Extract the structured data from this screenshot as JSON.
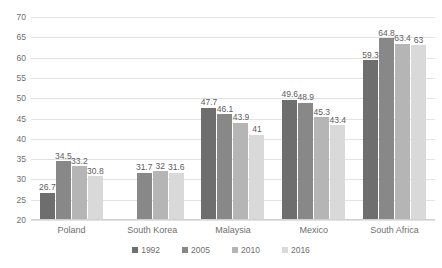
{
  "chart_data": {
    "type": "bar",
    "title": "",
    "subtitle": "",
    "xlabel": "",
    "ylabel": "",
    "categories": [
      "Poland",
      "South Korea",
      "Malaysia",
      "Mexico",
      "South Africa"
    ],
    "series": [
      {
        "name": "1992",
        "color": "#6e6e6e",
        "values": [
          26.7,
          null,
          47.7,
          49.6,
          59.3
        ],
        "labels": [
          "26.7",
          "",
          "47.7",
          "49.6",
          "59.3"
        ]
      },
      {
        "name": "2005",
        "color": "#888888",
        "values": [
          34.5,
          31.7,
          46.1,
          48.9,
          64.8
        ],
        "labels": [
          "34.5",
          "31.7",
          "46.1",
          "48.9",
          "64.8"
        ]
      },
      {
        "name": "2010",
        "color": "#b5b5b5",
        "values": [
          33.2,
          32,
          43.9,
          45.3,
          63.4
        ],
        "labels": [
          "33.2",
          "32",
          "43.9",
          "45.3",
          "63.4"
        ]
      },
      {
        "name": "2016",
        "color": "#d9d9d9",
        "values": [
          30.8,
          31.6,
          41,
          43.4,
          63
        ],
        "labels": [
          "30.8",
          "31.6",
          "41",
          "43.4",
          "63"
        ]
      }
    ],
    "ylim": [
      20,
      70
    ],
    "ytick_step": 5,
    "yticks": [
      70,
      65,
      60,
      55,
      50,
      45,
      40,
      35,
      30,
      25,
      20
    ],
    "ytick_labels": [
      "70",
      "65",
      "60",
      "55",
      "50",
      "45",
      "40",
      "35",
      "30",
      "25",
      "20"
    ],
    "grid": true,
    "legend_position": "bottom",
    "legend_entries": [
      "1992",
      "2005",
      "2010",
      "2016"
    ],
    "background_color": "#ffffff",
    "gridline_color": "#e3e3e3",
    "text_color": "#6f6f6f"
  }
}
